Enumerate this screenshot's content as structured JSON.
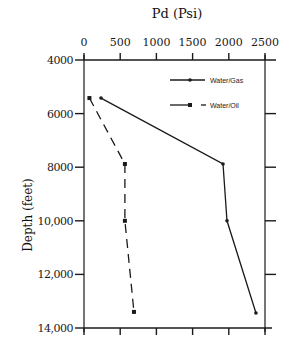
{
  "chart_data": {
    "type": "line",
    "title": "Pd (Psi)",
    "xlabel": "Pd (Psi)",
    "ylabel": "Depth (feet)",
    "x_axis_position": "top",
    "xlim": [
      0,
      2500
    ],
    "ylim": [
      4000,
      14000
    ],
    "y_inverted": true,
    "x_ticks": [
      "0",
      "500",
      "1000",
      "1500",
      "2000",
      "2500"
    ],
    "y_ticks": [
      "4000",
      "6000",
      "8000",
      "10,000",
      "12,000",
      "14,000"
    ],
    "grid": false,
    "legend_position": "upper right",
    "series": [
      {
        "name": "Water/Gas",
        "style": "solid",
        "marker": "dot",
        "points": [
          {
            "pd": 235,
            "depth": 5420
          },
          {
            "pd": 1920,
            "depth": 7880
          },
          {
            "pd": 1975,
            "depth": 10000
          },
          {
            "pd": 2375,
            "depth": 13440
          }
        ]
      },
      {
        "name": "Water/Oil",
        "style": "dashed",
        "marker": "square",
        "points": [
          {
            "pd": 75,
            "depth": 5420
          },
          {
            "pd": 565,
            "depth": 7880
          },
          {
            "pd": 565,
            "depth": 10000
          },
          {
            "pd": 690,
            "depth": 13400
          }
        ]
      }
    ]
  },
  "labels": {
    "x_title": "Pd (Psi)",
    "y_title": "Depth (feet)",
    "legend_gas": "Water/Gas",
    "legend_oil": "Water/Oil"
  }
}
